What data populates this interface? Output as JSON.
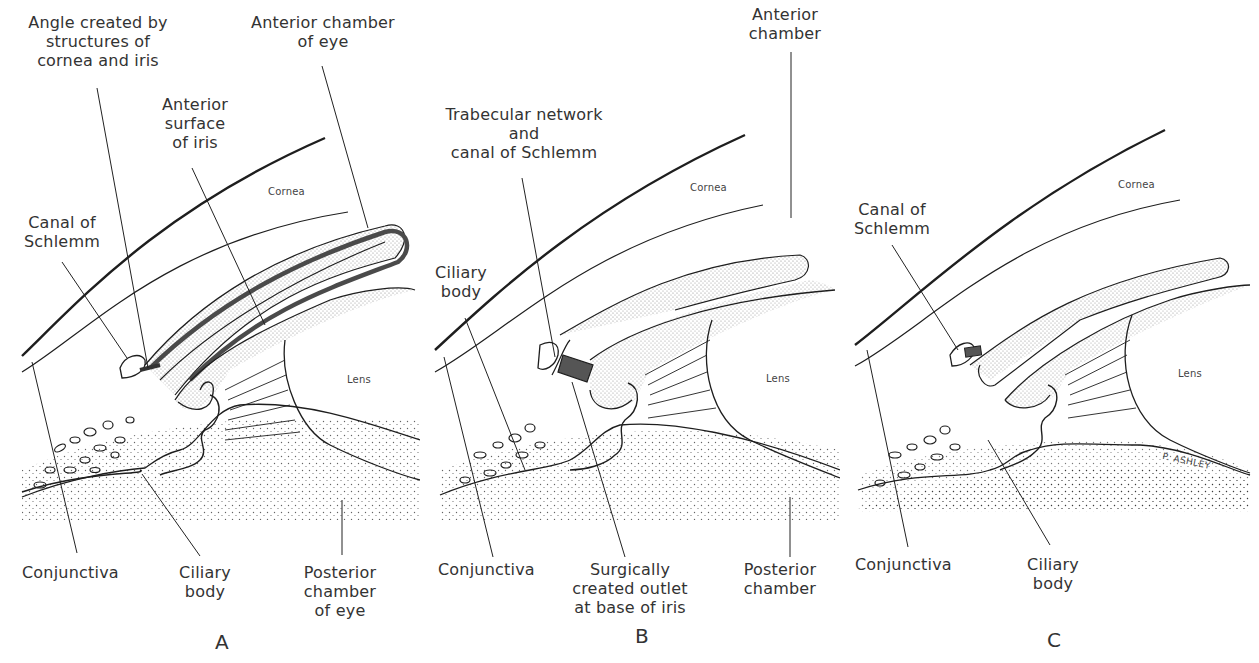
{
  "figure": {
    "panels": [
      {
        "id": "A",
        "letter": "A",
        "labels": {
          "angle": [
            "Angle created by",
            "structures of",
            "cornea and iris"
          ],
          "anterior_chamber": [
            "Anterior chamber",
            "of eye"
          ],
          "anterior_surface": [
            "Anterior",
            "surface",
            "of iris"
          ],
          "cornea": "Cornea",
          "canal": [
            "Canal of",
            "Schlemm"
          ],
          "lens": "Lens",
          "conjunctiva": "Conjunctiva",
          "ciliary": [
            "Ciliary",
            "body"
          ],
          "posterior": [
            "Posterior",
            "chamber",
            "of eye"
          ]
        }
      },
      {
        "id": "B",
        "letter": "B",
        "labels": {
          "anterior_chamber": [
            "Anterior",
            "chamber"
          ],
          "trabecular": [
            "Trabecular network",
            "and",
            "canal of Schlemm"
          ],
          "cornea": "Cornea",
          "ciliary": [
            "Ciliary",
            "body"
          ],
          "lens": "Lens",
          "conjunctiva": "Conjunctiva",
          "outlet": [
            "Surgically",
            "created outlet",
            "at base of iris"
          ],
          "posterior": [
            "Posterior",
            "chamber"
          ]
        }
      },
      {
        "id": "C",
        "letter": "C",
        "labels": {
          "cornea": "Cornea",
          "canal": [
            "Canal of",
            "Schlemm"
          ],
          "lens": "Lens",
          "conjunctiva": "Conjunctiva",
          "ciliary": [
            "Ciliary",
            "body"
          ],
          "signature": "P. ASHLEY"
        }
      }
    ],
    "colors": {
      "ink": "#1e1e1e",
      "text": "#333333",
      "highlight_fill": "#555555",
      "background": "#ffffff"
    }
  }
}
